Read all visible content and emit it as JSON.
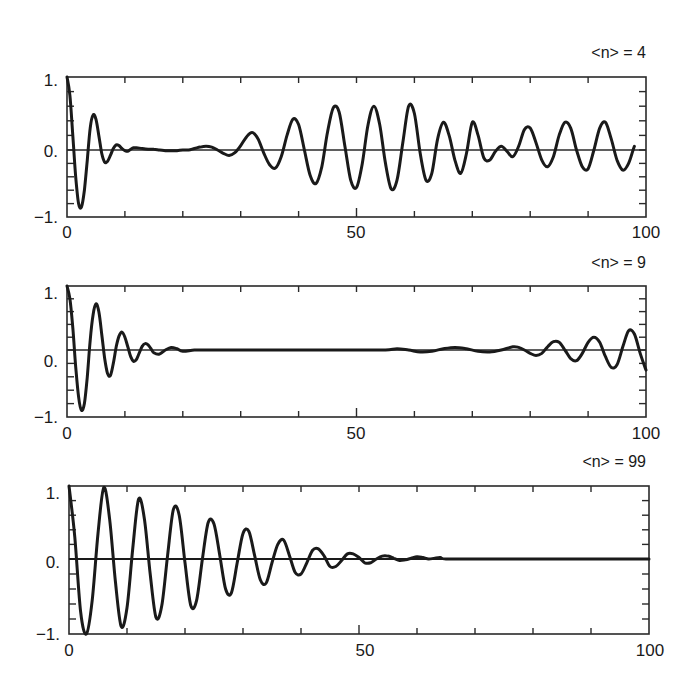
{
  "chart_data": [
    {
      "type": "line",
      "title": "<n> = 4",
      "xlabel": "",
      "ylabel": "",
      "xlim": [
        0,
        100
      ],
      "ylim": [
        -1,
        1
      ],
      "x_tick_labels": [
        "0",
        "50",
        "100"
      ],
      "y_tick_labels": [
        "1.",
        "0.",
        "-1."
      ],
      "grid": false,
      "reference_line_y": 0,
      "series": [
        {
          "name": "inversion",
          "x": [
            0,
            0.5,
            1,
            1.5,
            2,
            2.5,
            3,
            3.5,
            4,
            4.5,
            5,
            5.5,
            6,
            6.5,
            7,
            7.5,
            8,
            8.5,
            9,
            9.5,
            10,
            10.5,
            11,
            11.5,
            12,
            13,
            14,
            15,
            16,
            17,
            18,
            19,
            20,
            21,
            22,
            23,
            24,
            25,
            26,
            27,
            28,
            29,
            30,
            31,
            32,
            33,
            34,
            35,
            36,
            37,
            38,
            39,
            40,
            41,
            42,
            43,
            44,
            45,
            46,
            47,
            48,
            49,
            50,
            51,
            52,
            53,
            54,
            55,
            56,
            57,
            58,
            59,
            60,
            61,
            62,
            63,
            64,
            65,
            66,
            67,
            68,
            69,
            70,
            71,
            72,
            73,
            74,
            75,
            76,
            77,
            78,
            79,
            80,
            81,
            82,
            83,
            84,
            85,
            86,
            87,
            88,
            89,
            90,
            91,
            92,
            93,
            94,
            95,
            96,
            97,
            98,
            99,
            100
          ],
          "values": [
            1.0,
            0.75,
            0.2,
            -0.4,
            -0.8,
            -0.85,
            -0.6,
            -0.15,
            0.3,
            0.48,
            0.42,
            0.2,
            -0.05,
            -0.18,
            -0.17,
            -0.08,
            0.02,
            0.07,
            0.06,
            0.02,
            -0.01,
            -0.02,
            0.01,
            0.03,
            0.03,
            0.02,
            0.01,
            0.01,
            0.0,
            -0.01,
            -0.01,
            -0.01,
            0.0,
            0.0,
            0.02,
            0.04,
            0.05,
            0.04,
            0.0,
            -0.05,
            -0.08,
            -0.04,
            0.06,
            0.18,
            0.24,
            0.15,
            -0.05,
            -0.22,
            -0.27,
            -0.1,
            0.2,
            0.42,
            0.35,
            0.0,
            -0.38,
            -0.5,
            -0.25,
            0.25,
            0.58,
            0.52,
            0.05,
            -0.45,
            -0.56,
            -0.2,
            0.35,
            0.6,
            0.35,
            -0.2,
            -0.58,
            -0.45,
            0.1,
            0.6,
            0.5,
            -0.05,
            -0.45,
            -0.35,
            0.15,
            0.38,
            0.2,
            -0.15,
            -0.35,
            -0.05,
            0.38,
            0.2,
            -0.12,
            -0.15,
            -0.02,
            0.05,
            -0.02,
            -0.1,
            0.05,
            0.28,
            0.3,
            0.1,
            -0.15,
            -0.25,
            -0.1,
            0.2,
            0.38,
            0.3,
            0.0,
            -0.25,
            -0.28,
            0.0,
            0.3,
            0.38,
            0.15,
            -0.15,
            -0.3,
            -0.2,
            0.05,
            0.2
          ]
        }
      ]
    },
    {
      "type": "line",
      "title": "<n> = 9",
      "xlabel": "",
      "ylabel": "",
      "xlim": [
        0,
        100
      ],
      "ylim": [
        -1,
        1
      ],
      "x_tick_labels": [
        "0",
        "50",
        "100"
      ],
      "y_tick_labels": [
        "1.",
        "0.",
        "-1."
      ],
      "grid": false,
      "reference_line_y": 0,
      "series": [
        {
          "name": "inversion",
          "x": [
            0,
            0.5,
            1,
            1.5,
            2,
            2.5,
            3,
            3.5,
            4,
            4.5,
            5,
            5.5,
            6,
            6.5,
            7,
            7.5,
            8,
            8.5,
            9,
            9.5,
            10,
            10.5,
            11,
            11.5,
            12,
            12.5,
            13,
            13.5,
            14,
            14.5,
            15,
            16,
            17,
            18,
            19,
            20,
            22,
            24,
            26,
            30,
            40,
            50,
            55,
            57,
            59,
            61,
            63,
            65,
            67,
            69,
            71,
            73,
            75,
            77,
            78,
            79,
            80,
            81,
            82,
            83,
            84,
            85,
            86,
            87,
            88,
            89,
            90,
            91,
            92,
            93,
            94,
            95,
            96,
            97,
            98,
            99,
            100
          ],
          "values": [
            1.0,
            0.8,
            0.35,
            -0.25,
            -0.7,
            -0.9,
            -0.8,
            -0.4,
            0.15,
            0.55,
            0.72,
            0.6,
            0.25,
            -0.12,
            -0.35,
            -0.38,
            -0.2,
            0.05,
            0.22,
            0.28,
            0.2,
            0.05,
            -0.1,
            -0.17,
            -0.14,
            -0.04,
            0.06,
            0.1,
            0.08,
            0.02,
            -0.04,
            -0.06,
            0.0,
            0.04,
            0.02,
            -0.02,
            0.0,
            0.0,
            0.0,
            0.0,
            0.0,
            0.0,
            0.0,
            0.02,
            0.0,
            -0.03,
            -0.02,
            0.02,
            0.04,
            0.02,
            -0.02,
            -0.03,
            0.0,
            0.05,
            0.04,
            0.0,
            -0.05,
            -0.08,
            -0.05,
            0.05,
            0.13,
            0.12,
            0.0,
            -0.13,
            -0.16,
            -0.05,
            0.12,
            0.2,
            0.12,
            -0.1,
            -0.26,
            -0.22,
            0.05,
            0.3,
            0.25,
            -0.05,
            -0.3,
            -0.25,
            0.05,
            0.35
          ]
        }
      ]
    },
    {
      "type": "line",
      "title": "<n> = 99",
      "xlabel": "",
      "ylabel": "",
      "xlim": [
        0,
        100
      ],
      "ylim": [
        -1,
        1
      ],
      "x_tick_labels": [
        "0",
        "50",
        "100"
      ],
      "y_tick_labels": [
        "1.",
        "0.",
        "-1."
      ],
      "grid": false,
      "reference_line_y": 0,
      "series": [
        {
          "name": "inversion",
          "x": [
            0,
            1,
            2,
            3,
            4,
            5,
            6,
            7,
            8,
            9,
            10,
            11,
            12,
            13,
            14,
            15,
            16,
            17,
            18,
            19,
            20,
            21,
            22,
            23,
            24,
            25,
            26,
            27,
            28,
            29,
            30,
            31,
            32,
            33,
            34,
            35,
            36,
            37,
            38,
            39,
            40,
            41,
            42,
            43,
            44,
            45,
            46,
            47,
            48,
            49,
            50,
            51,
            52,
            53,
            54,
            55,
            56,
            57,
            58,
            59,
            60,
            61,
            62,
            63,
            64,
            65,
            70,
            80,
            90,
            100
          ],
          "values": [
            1.0,
            0.3,
            -0.7,
            -1.0,
            -0.55,
            0.35,
            0.98,
            0.55,
            -0.3,
            -0.9,
            -0.65,
            0.15,
            0.82,
            0.55,
            -0.2,
            -0.78,
            -0.62,
            0.05,
            0.68,
            0.6,
            -0.05,
            -0.62,
            -0.55,
            0.0,
            0.5,
            0.48,
            0.05,
            -0.4,
            -0.45,
            -0.05,
            0.35,
            0.38,
            0.05,
            -0.28,
            -0.32,
            -0.05,
            0.2,
            0.26,
            0.05,
            -0.18,
            -0.2,
            -0.05,
            0.12,
            0.14,
            0.04,
            -0.1,
            -0.1,
            -0.02,
            0.07,
            0.07,
            0.02,
            -0.05,
            -0.05,
            0.0,
            0.04,
            0.04,
            0.01,
            -0.02,
            -0.01,
            0.01,
            0.03,
            0.02,
            0.0,
            0.01,
            0.02,
            0.0,
            0.0,
            0.0,
            0.0,
            0.0
          ]
        }
      ]
    }
  ],
  "panels": [
    {
      "title": "<n> = 4",
      "y_labels": [
        "1.",
        "0.",
        "−1."
      ],
      "x_labels": [
        "0",
        "50",
        "100"
      ]
    },
    {
      "title": "<n> = 9",
      "y_labels": [
        "1.",
        "0.",
        "−1."
      ],
      "x_labels": [
        "0",
        "50",
        "100"
      ]
    },
    {
      "title": "<n> = 99",
      "y_labels": [
        "1.",
        "0.",
        "−1."
      ],
      "x_labels": [
        "0",
        "50",
        "100"
      ]
    }
  ],
  "colors": {
    "line": "#1a1a1a",
    "axes": "#2a2a2a",
    "background": "#ffffff"
  }
}
